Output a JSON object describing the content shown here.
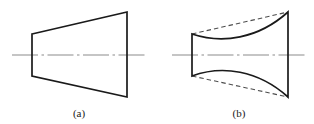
{
  "figure": {
    "background_color": "#ffffff",
    "width": 314,
    "height": 124,
    "outline_color": "#1a1a1a",
    "reference_color": "#4d4d4d",
    "axis_color": "#8c8c8c",
    "panels": [
      {
        "id": "a",
        "caption": "(a)",
        "caption_x": 79,
        "caption_y": 117,
        "description": "undistorted truncated cone profile with straight slanted edges",
        "geometry": {
          "left_x": 32,
          "right_x": 127,
          "left_top_y": 34,
          "left_bottom_y": 76,
          "right_top_y": 12,
          "right_bottom_y": 97,
          "axis_y": 55,
          "axis_start_x": 12,
          "axis_end_x": 147
        },
        "outline_path": "M 32 34 L 127 12 L 127 97 L 32 76 Z",
        "has_reference_lines": false
      },
      {
        "id": "b",
        "caption": "(b)",
        "caption_x": 239,
        "caption_y": 117,
        "description": "distorted profile: solid edges curve inward toward the axis while dashed lines mark the original straight edges",
        "geometry": {
          "left_x": 192,
          "right_x": 288,
          "left_top_y": 34,
          "left_bottom_y": 76,
          "right_top_y": 12,
          "right_bottom_y": 97,
          "axis_y": 55,
          "axis_start_x": 172,
          "axis_end_x": 308
        },
        "outline_path": "M 192 34 C 222 44 258 39 288 12 L 288 97 C 258 70 222 65 192 76 Z",
        "has_reference_lines": true,
        "reference_paths": [
          "M 192 34 L 288 12",
          "M 192 76 L 288 97"
        ]
      }
    ]
  }
}
